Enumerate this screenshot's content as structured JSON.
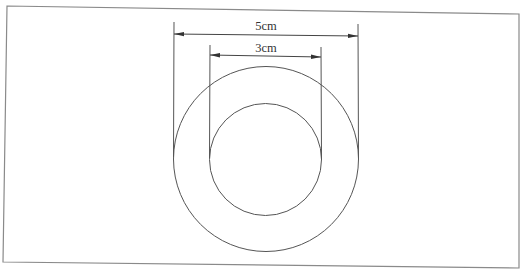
{
  "diagram": {
    "type": "concentric-circles-dimension",
    "frame": {
      "stroke": "#8a8a8a"
    },
    "outer_circle": {
      "label": "5cm",
      "diameter_cm": 5,
      "cx": 266,
      "cy": 159,
      "r": 92.5
    },
    "inner_circle": {
      "label": "3cm",
      "diameter_cm": 3,
      "cx": 265.5,
      "cy": 159.5,
      "r": 56
    },
    "colors": {
      "line": "#444444",
      "text": "#333333"
    }
  }
}
